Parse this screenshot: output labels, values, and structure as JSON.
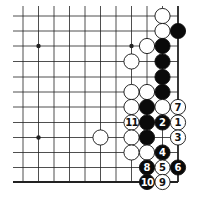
{
  "diagram": {
    "type": "go-board-problem",
    "grid": {
      "columns_x": [
        23,
        38.5,
        54,
        69.5,
        85,
        100.5,
        116,
        131.5,
        147,
        162.5,
        178
      ],
      "rows_y": [
        16,
        31,
        46,
        61.5,
        77,
        92,
        107,
        122.5,
        137.5,
        152.5,
        167.5,
        182
      ],
      "line_left_x": 13,
      "line_top_y": 6,
      "right_edge_col": 10,
      "bottom_edge_row": 11
    },
    "star_points": [
      {
        "col": 1,
        "row": 2
      },
      {
        "col": 7,
        "row": 2
      },
      {
        "col": 1,
        "row": 8
      }
    ],
    "stones": [
      {
        "col": 9,
        "row": 0,
        "color": "white",
        "label": ""
      },
      {
        "col": 9,
        "row": 1,
        "color": "white",
        "label": ""
      },
      {
        "col": 10,
        "row": 1,
        "color": "black",
        "label": ""
      },
      {
        "col": 8,
        "row": 2,
        "color": "white",
        "label": ""
      },
      {
        "col": 9,
        "row": 2,
        "color": "black",
        "label": ""
      },
      {
        "col": 7,
        "row": 3,
        "color": "white",
        "label": ""
      },
      {
        "col": 9,
        "row": 3,
        "color": "black",
        "label": ""
      },
      {
        "col": 9,
        "row": 4,
        "color": "black",
        "label": ""
      },
      {
        "col": 7,
        "row": 5,
        "color": "white",
        "label": ""
      },
      {
        "col": 8,
        "row": 5,
        "color": "white",
        "label": ""
      },
      {
        "col": 9,
        "row": 5,
        "color": "black",
        "label": ""
      },
      {
        "col": 7,
        "row": 6,
        "color": "white",
        "label": ""
      },
      {
        "col": 8,
        "row": 6,
        "color": "black",
        "label": ""
      },
      {
        "col": 9,
        "row": 6,
        "color": "white",
        "label": ""
      },
      {
        "col": 10,
        "row": 6,
        "color": "white",
        "label": "7"
      },
      {
        "col": 7,
        "row": 7,
        "color": "white",
        "label": "11"
      },
      {
        "col": 8,
        "row": 7,
        "color": "black",
        "label": ""
      },
      {
        "col": 9,
        "row": 7,
        "color": "black",
        "label": "2"
      },
      {
        "col": 10,
        "row": 7,
        "color": "white",
        "label": "1"
      },
      {
        "col": 5,
        "row": 8,
        "color": "white",
        "label": ""
      },
      {
        "col": 7,
        "row": 8,
        "color": "white",
        "label": ""
      },
      {
        "col": 8,
        "row": 8,
        "color": "black",
        "label": ""
      },
      {
        "col": 10,
        "row": 8,
        "color": "white",
        "label": "3"
      },
      {
        "col": 7,
        "row": 9,
        "color": "white",
        "label": ""
      },
      {
        "col": 8,
        "row": 9,
        "color": "white",
        "label": ""
      },
      {
        "col": 9,
        "row": 9,
        "color": "black",
        "label": "4"
      },
      {
        "col": 8,
        "row": 10,
        "color": "black",
        "label": "8"
      },
      {
        "col": 9,
        "row": 10,
        "color": "white",
        "label": "5"
      },
      {
        "col": 10,
        "row": 10,
        "color": "black",
        "label": "6"
      },
      {
        "col": 8,
        "row": 11,
        "color": "black",
        "label": "10"
      },
      {
        "col": 9,
        "row": 11,
        "color": "white",
        "label": "9"
      }
    ],
    "colors": {
      "line": "#222222",
      "black_stone": "#0a0a0a",
      "white_stone": "#ffffff",
      "stone_outline": "#111111",
      "background": "#ffffff"
    },
    "stone_radius": 7.6
  }
}
